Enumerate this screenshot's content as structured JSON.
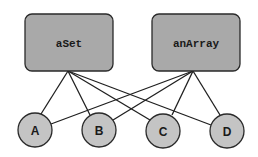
{
  "diagram": {
    "colors": {
      "box_fill": "#a9a9a9",
      "node_fill": "#c4c4c4",
      "stroke": "#2a2a2a",
      "background": "#ffffff"
    },
    "containers": [
      {
        "id": "aSet",
        "label": "aSet",
        "x": 25,
        "y": 14,
        "w": 88,
        "h": 57,
        "anchor": [
          68,
          71
        ]
      },
      {
        "id": "anArray",
        "label": "anArray",
        "x": 152,
        "y": 14,
        "w": 88,
        "h": 57,
        "anchor": [
          193,
          71
        ]
      }
    ],
    "nodes": [
      {
        "id": "A",
        "label": "A",
        "cx": 35,
        "cy": 130,
        "r": 17
      },
      {
        "id": "B",
        "label": "B",
        "cx": 99,
        "cy": 130,
        "r": 17
      },
      {
        "id": "C",
        "label": "C",
        "cx": 163,
        "cy": 131,
        "r": 17
      },
      {
        "id": "D",
        "label": "D",
        "cx": 227,
        "cy": 131,
        "r": 17
      }
    ],
    "edges": [
      {
        "from": "aSet",
        "to": "A",
        "x1": 68,
        "y1": 71,
        "x2": 41,
        "y2": 114
      },
      {
        "from": "aSet",
        "to": "B",
        "x1": 68,
        "y1": 71,
        "x2": 90,
        "y2": 115
      },
      {
        "from": "aSet",
        "to": "C",
        "x1": 68,
        "y1": 71,
        "x2": 150,
        "y2": 120
      },
      {
        "from": "aSet",
        "to": "D",
        "x1": 68,
        "y1": 71,
        "x2": 211,
        "y2": 125
      },
      {
        "from": "anArray",
        "to": "A",
        "x1": 193,
        "y1": 71,
        "x2": 51,
        "y2": 124
      },
      {
        "from": "anArray",
        "to": "B",
        "x1": 193,
        "y1": 71,
        "x2": 113,
        "y2": 120
      },
      {
        "from": "anArray",
        "to": "C",
        "x1": 193,
        "y1": 71,
        "x2": 172,
        "y2": 115
      },
      {
        "from": "anArray",
        "to": "D",
        "x1": 193,
        "y1": 71,
        "x2": 220,
        "y2": 115
      }
    ]
  }
}
